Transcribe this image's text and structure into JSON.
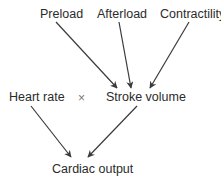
{
  "diagram": {
    "nodes": {
      "preload": "Preload",
      "afterload": "Afterload",
      "contractility": "Contractility",
      "heart_rate": "Heart rate",
      "operator": "×",
      "stroke_volume": "Stroke volume",
      "cardiac_output": "Cardiac output"
    },
    "edges": [
      {
        "from": "Preload",
        "to": "Stroke volume"
      },
      {
        "from": "Afterload",
        "to": "Stroke volume"
      },
      {
        "from": "Contractility",
        "to": "Stroke volume"
      },
      {
        "from": "Heart rate",
        "to": "Cardiac output"
      },
      {
        "from": "Stroke volume",
        "to": "Cardiac output"
      }
    ],
    "colors": {
      "text": "#2b2b2b",
      "arrow": "#3a3a3a"
    }
  }
}
